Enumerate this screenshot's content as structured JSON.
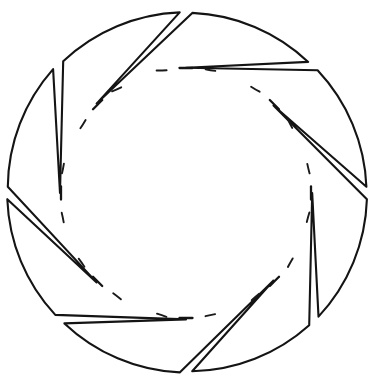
{
  "figure": {
    "title": "Eight-lobed rosette outline",
    "style": "hand-drawn ink line art",
    "background_color": "#ffffff",
    "stroke_color": "#141414",
    "stroke_width": 2.1,
    "canvas": {
      "width": 374,
      "height": 387
    },
    "geometry": {
      "center_x": 186,
      "center_y": 193,
      "lobe_count": 8,
      "outer_radius": 180,
      "inner_radius": 125,
      "lobe_half_angle_deg": 20.5,
      "notch_angles_deg": [
        90,
        45,
        0,
        315,
        270,
        225,
        180,
        135
      ],
      "bounding_box": {
        "left": 13,
        "top": 14,
        "right": 360,
        "bottom": 372
      }
    },
    "inner_circle": {
      "style": "dashed",
      "radius": 125,
      "dash_per_lobe": 1,
      "tick_at_each_notch": true,
      "tick_length": 13
    },
    "parts": [
      {
        "name": "lobe",
        "count": 8,
        "shape": "curved outer arc with two straight inward-converging sides"
      },
      {
        "name": "notch",
        "count": 8,
        "shape": "V-shaped wedge pointing toward the centre"
      },
      {
        "name": "inner-dashed-circle",
        "count": 1,
        "shape": "broken circular guide line"
      }
    ]
  }
}
